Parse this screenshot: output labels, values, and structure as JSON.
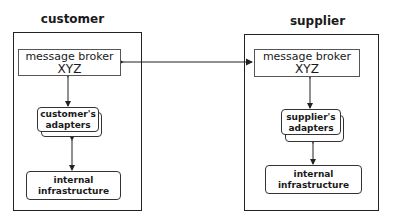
{
  "customer": {
    "title": "customer",
    "broker": {
      "line1": "message broker",
      "line2": "XYZ"
    },
    "adapters": {
      "line1": "customer's",
      "line2": "adapters"
    },
    "internal": {
      "line1": "internal",
      "line2": "infrastructure"
    }
  },
  "supplier": {
    "title": "supplier",
    "broker": {
      "line1": "message broker",
      "line2": "XYZ"
    },
    "adapters": {
      "line1": "supplier's",
      "line2": "adapters"
    },
    "internal": {
      "line1": "internal",
      "line2": "infrastructure"
    }
  },
  "colors": {
    "stroke": "#222222",
    "background": "#ffffff"
  }
}
